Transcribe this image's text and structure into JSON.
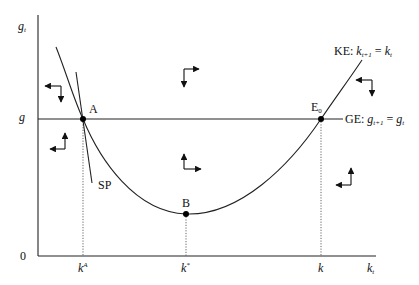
{
  "diagram": {
    "type": "phase-diagram",
    "axes": {
      "y_label": "g",
      "y_label_sub": "t",
      "x_label": "k",
      "x_label_sub": "t",
      "origin_label": "0",
      "y_tick_label": "g"
    },
    "x_ticks": [
      {
        "base": "k",
        "sup": "A"
      },
      {
        "base": "k",
        "sup": "*"
      },
      {
        "base": "k",
        "sup": ""
      }
    ],
    "curves": {
      "ke": {
        "prefix": "KE: ",
        "lhs": "k",
        "lhs_sub": "t+1",
        "eq": " = ",
        "rhs": "k",
        "rhs_sub": "t"
      },
      "ge": {
        "prefix": "GE: ",
        "lhs": "g",
        "lhs_sub": "t+1",
        "eq": " = ",
        "rhs": "g",
        "rhs_sub": "t"
      },
      "sp": {
        "label": "SP"
      }
    },
    "points": {
      "a": "A",
      "b": "B",
      "e0": "E",
      "e0_sub": "0"
    },
    "arrows": [
      {
        "region": "upper-left",
        "dirs": [
          "left",
          "down"
        ]
      },
      {
        "region": "lower-left",
        "dirs": [
          "left",
          "up"
        ]
      },
      {
        "region": "upper-middle",
        "dirs": [
          "right",
          "down"
        ]
      },
      {
        "region": "lower-middle",
        "dirs": [
          "right",
          "up"
        ]
      },
      {
        "region": "upper-right",
        "dirs": [
          "left",
          "down"
        ]
      },
      {
        "region": "lower-right",
        "dirs": [
          "left",
          "up"
        ]
      }
    ],
    "colors": {
      "line": "#222222",
      "dotted": "#555555",
      "background": "#ffffff"
    }
  }
}
